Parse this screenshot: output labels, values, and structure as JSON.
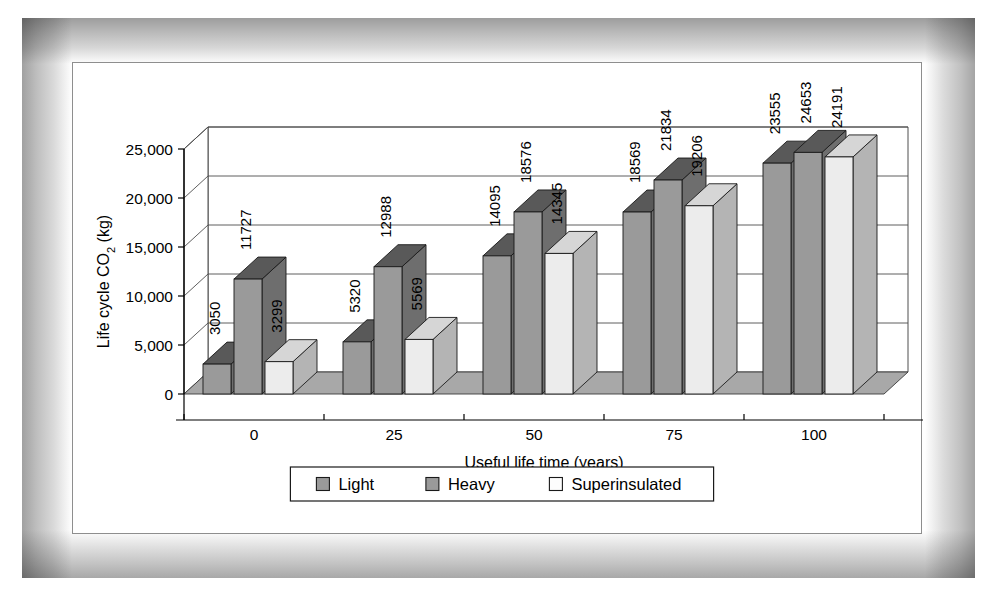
{
  "chart_data": {
    "type": "bar",
    "title": "",
    "xlabel": "Useful life time (years)",
    "ylabel": "Life cycle CO2 (kg)",
    "ylabel_parts": {
      "pre": "Life cycle CO",
      "sub": "2",
      "post": " (kg)"
    },
    "categories": [
      "0",
      "25",
      "50",
      "75",
      "100"
    ],
    "series": [
      {
        "name": "Light",
        "values": [
          3050,
          5320,
          14095,
          18569,
          23555
        ],
        "color": "#9a9a9a"
      },
      {
        "name": "Heavy",
        "values": [
          11727,
          12988,
          18576,
          21834,
          24653
        ],
        "color": "#9a9a9a"
      },
      {
        "name": "Superinsulated",
        "values": [
          3299,
          5569,
          14345,
          19206,
          24191
        ],
        "color": "#ececec"
      }
    ],
    "ylim": [
      0,
      25000
    ],
    "yticks": [
      0,
      5000,
      10000,
      15000,
      20000,
      25000
    ],
    "ytick_labels": [
      "0",
      "5,000",
      "10,000",
      "15,000",
      "20,000",
      "25,000"
    ],
    "grid": true,
    "legend_position": "bottom",
    "style": "3d-perspective-clustered-column",
    "data_labels": {
      "0": [
        "3050",
        "11727",
        "3299"
      ],
      "25": [
        "5320",
        "12988",
        "5569"
      ],
      "50": [
        "14095",
        "18576",
        "14345"
      ],
      "75": [
        "18569",
        "21834",
        "19206"
      ],
      "100": [
        "23555",
        "24653",
        "24191"
      ]
    },
    "colors": {
      "bar_front_dark": "#9a9a9a",
      "bar_front_light": "#ececec",
      "bar_side_dark": "#6e6e6e",
      "bar_side_light": "#b4b4b4",
      "bar_top_dark": "#595959",
      "bar_top_light": "#d6d6d6",
      "floor": "#a8a8a8",
      "wall": "#ffffff",
      "outline": "#1a1a1a",
      "gridline": "#4d4d4d"
    }
  },
  "legend": {
    "items": [
      {
        "label": "Light",
        "swatch": "#9a9a9a"
      },
      {
        "label": "Heavy",
        "swatch": "#9a9a9a"
      },
      {
        "label": "Superinsulated",
        "swatch": "#fdfdfd"
      }
    ]
  }
}
